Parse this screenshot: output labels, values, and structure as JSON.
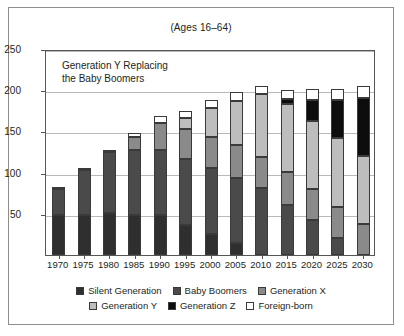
{
  "header": {
    "note": "(Ages 16–64)"
  },
  "annotation": {
    "text": "Generation Y Replacing\n   the Baby Boomers"
  },
  "legend": {
    "row1": [
      {
        "label": "Silent Generation",
        "color": "#2f2f2f"
      },
      {
        "label": "Baby Boomers",
        "color": "#4a4a4a"
      },
      {
        "label": "Generation X",
        "color": "#8a8a8a"
      }
    ],
    "row2": [
      {
        "label": "Generation Y",
        "color": "#bdbdbd"
      },
      {
        "label": "Generation Z",
        "color": "#0d0d0d"
      },
      {
        "label": "Foreign-born",
        "color": "#ffffff"
      }
    ]
  },
  "chart_data": {
    "type": "bar",
    "title": "(Ages 16–64)",
    "subtitle": "Generation Y Replacing the Baby Boomers",
    "stacked": true,
    "xlabel": "",
    "ylabel": "",
    "ylim": [
      0,
      250
    ],
    "yticks": [
      0,
      50,
      100,
      150,
      200,
      250
    ],
    "ytick_labels": [
      "",
      "50",
      "100",
      "150",
      "200",
      "250"
    ],
    "grid": true,
    "legend_position": "bottom",
    "categories": [
      "1970",
      "1975",
      "1980",
      "1985",
      "1990",
      "1995",
      "2000",
      "2005",
      "2010",
      "2015",
      "2020",
      "2025",
      "2030"
    ],
    "series": [
      {
        "name": "Silent Generation",
        "color": "#2f2f2f",
        "values": [
          48,
          49,
          51,
          48,
          48,
          36,
          25,
          14,
          0,
          0,
          0,
          0,
          0
        ]
      },
      {
        "name": "Baby Boomers",
        "color": "#4a4a4a",
        "values": [
          32,
          54,
          74,
          80,
          80,
          80,
          81,
          80,
          81,
          61,
          42,
          21,
          0
        ]
      },
      {
        "name": "Generation X",
        "color": "#8a8a8a",
        "values": [
          0,
          0,
          0,
          15,
          32,
          37,
          37,
          39,
          38,
          40,
          38,
          37,
          38
        ]
      },
      {
        "name": "Generation Y",
        "color": "#bdbdbd",
        "values": [
          0,
          0,
          0,
          0,
          0,
          13,
          36,
          54,
          77,
          82,
          83,
          84,
          82
        ]
      },
      {
        "name": "Generation Z",
        "color": "#0d0d0d",
        "values": [
          0,
          0,
          0,
          0,
          0,
          0,
          0,
          0,
          0,
          6,
          25,
          46,
          70
        ]
      },
      {
        "name": "Foreign-born",
        "color": "#ffffff",
        "values": [
          3,
          2,
          2,
          5,
          9,
          9,
          9,
          11,
          9,
          11,
          13,
          14,
          15
        ]
      }
    ],
    "totals": [
      83,
      105,
      127,
      148,
      169,
      175,
      188,
      198,
      205,
      200,
      201,
      202,
      205
    ]
  }
}
